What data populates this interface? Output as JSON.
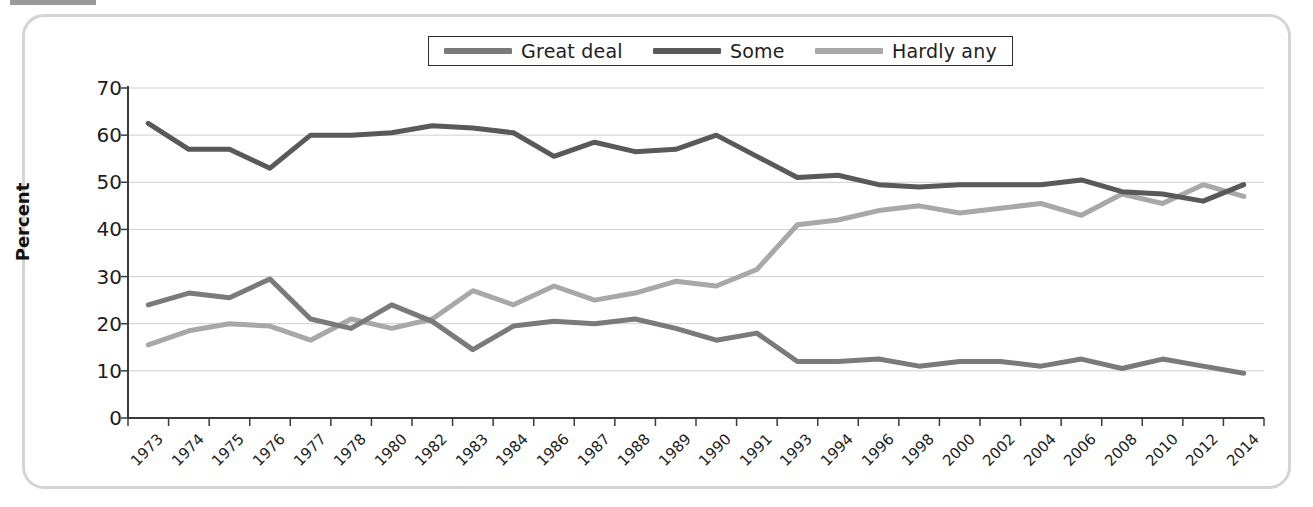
{
  "chart_data": {
    "type": "line",
    "title": "",
    "xlabel": "",
    "ylabel": "Percent",
    "ylim": [
      0,
      70
    ],
    "ytick_step": 10,
    "yticks": [
      0,
      10,
      20,
      30,
      40,
      50,
      60,
      70
    ],
    "grid": "horizontal",
    "legend_position": "top-center",
    "categories": [
      "1973",
      "1974",
      "1975",
      "1976",
      "1977",
      "1978",
      "1980",
      "1982",
      "1983",
      "1984",
      "1986",
      "1987",
      "1988",
      "1989",
      "1990",
      "1991",
      "1993",
      "1994",
      "1996",
      "1998",
      "2000",
      "2002",
      "2004",
      "2006",
      "2008",
      "2010",
      "2012",
      "2014"
    ],
    "series": [
      {
        "name": "Great deal",
        "color": "#7a7a7a",
        "values": [
          24.0,
          26.5,
          25.5,
          29.5,
          21.0,
          19.0,
          24.0,
          20.5,
          14.5,
          19.5,
          20.5,
          20.0,
          21.0,
          19.0,
          16.5,
          18.0,
          12.0,
          12.0,
          12.5,
          11.0,
          12.0,
          12.0,
          11.0,
          12.5,
          10.5,
          12.5,
          11.0,
          9.5
        ]
      },
      {
        "name": "Some",
        "color": "#595959",
        "values": [
          62.5,
          57.0,
          57.0,
          53.0,
          60.0,
          60.0,
          60.5,
          62.0,
          61.5,
          60.5,
          55.5,
          58.5,
          56.5,
          57.0,
          60.0,
          55.5,
          51.0,
          51.5,
          49.5,
          49.0,
          49.5,
          49.5,
          49.5,
          50.5,
          48.0,
          47.5,
          46.0,
          49.5
        ]
      },
      {
        "name": "Hardly any",
        "color": "#a8a8a8",
        "values": [
          15.5,
          18.5,
          20.0,
          19.5,
          16.5,
          21.0,
          19.0,
          21.0,
          27.0,
          24.0,
          28.0,
          25.0,
          26.5,
          29.0,
          28.0,
          31.5,
          41.0,
          42.0,
          44.0,
          45.0,
          43.5,
          44.5,
          45.5,
          43.0,
          47.5,
          45.5,
          49.5,
          47.0
        ]
      }
    ]
  },
  "legend": {
    "items": [
      {
        "label": "Great deal"
      },
      {
        "label": "Some"
      },
      {
        "label": "Hardly any"
      }
    ]
  },
  "axis": {
    "y_title": "Percent"
  }
}
